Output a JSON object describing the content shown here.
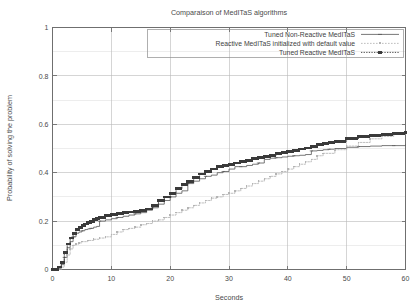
{
  "chart_data": {
    "type": "line",
    "title": "Comparaison of MedITaS algorithms",
    "xlabel": "Seconds",
    "ylabel": "Probability of solving the problem",
    "xlim": [
      0,
      60
    ],
    "ylim": [
      0,
      1
    ],
    "xticks": [
      "0",
      "10",
      "20",
      "30",
      "40",
      "50",
      "60"
    ],
    "yticks": [
      "0",
      "0.2",
      "0.4",
      "0.6",
      "0.8",
      "1"
    ],
    "xtick_values": [
      0,
      10,
      20,
      30,
      40,
      50,
      60
    ],
    "ytick_values": [
      0,
      0.2,
      0.4,
      0.6,
      0.8,
      1
    ],
    "grid": "major and minor horizontal gridlines at 0.1 steps, vertical at 10 s steps",
    "legend_position": "top-right inside plot",
    "series": [
      {
        "name": "Tuned Non-Reactive MedITaS",
        "style": "solid-thin-line",
        "color": "#555555",
        "x": [
          0,
          1.0,
          1.5,
          2.0,
          2.5,
          3.0,
          3.5,
          4.0,
          4.5,
          5.0,
          5.5,
          6.0,
          6.5,
          7.0,
          7.5,
          8.0,
          9.0,
          10.0,
          11.0,
          12.0,
          13.0,
          14.0,
          15.0,
          16.0,
          17.0,
          18.0,
          19.0,
          20.0,
          21.0,
          22.0,
          23.0,
          24.0,
          25.0,
          26.0,
          27.0,
          28.0,
          29.0,
          30.0,
          31.0,
          32.0,
          33.0,
          34.0,
          35.0,
          36.0,
          37.0,
          38.0,
          39.0,
          40.0,
          41.0,
          42.0,
          43.0,
          44.0,
          45.0,
          46.0,
          47.0,
          48.0,
          50.0,
          52.0,
          54.0,
          56.0,
          58.0,
          60.0
        ],
        "y": [
          0.0,
          0.005,
          0.02,
          0.05,
          0.09,
          0.115,
          0.135,
          0.15,
          0.155,
          0.16,
          0.165,
          0.168,
          0.17,
          0.175,
          0.178,
          0.2,
          0.205,
          0.21,
          0.215,
          0.22,
          0.225,
          0.23,
          0.235,
          0.245,
          0.255,
          0.27,
          0.285,
          0.3,
          0.315,
          0.325,
          0.355,
          0.365,
          0.375,
          0.385,
          0.39,
          0.4,
          0.405,
          0.415,
          0.425,
          0.425,
          0.43,
          0.435,
          0.44,
          0.455,
          0.46,
          0.462,
          0.465,
          0.468,
          0.47,
          0.472,
          0.475,
          0.49,
          0.492,
          0.495,
          0.497,
          0.5,
          0.505,
          0.508,
          0.51,
          0.512,
          0.512,
          0.515
        ]
      },
      {
        "name": "Reactive MedITaS initialized with default value",
        "style": "light-dotted-line",
        "color": "#b4b4b4",
        "x": [
          0,
          1.5,
          2.0,
          2.5,
          3.0,
          3.5,
          4.0,
          4.5,
          5.0,
          6.0,
          7.0,
          8.0,
          9.0,
          10.0,
          11.0,
          12.0,
          13.0,
          14.0,
          15.0,
          16.0,
          17.0,
          18.0,
          19.0,
          20.0,
          21.0,
          22.0,
          23.0,
          24.0,
          25.0,
          26.0,
          27.0,
          28.0,
          29.0,
          30.0,
          31.0,
          32.0,
          33.0,
          34.0,
          35.0,
          36.0,
          37.0,
          38.0,
          39.0,
          40.0,
          41.0,
          42.0,
          43.0,
          44.0,
          45.0,
          46.0,
          48.0,
          50.0,
          52.0,
          54.0,
          56.0,
          58.0,
          60.0
        ],
        "y": [
          0.0,
          0.01,
          0.03,
          0.06,
          0.085,
          0.1,
          0.105,
          0.11,
          0.115,
          0.12,
          0.125,
          0.13,
          0.135,
          0.145,
          0.155,
          0.165,
          0.17,
          0.175,
          0.185,
          0.19,
          0.2,
          0.205,
          0.215,
          0.225,
          0.235,
          0.245,
          0.255,
          0.265,
          0.275,
          0.285,
          0.295,
          0.3,
          0.31,
          0.315,
          0.325,
          0.335,
          0.345,
          0.355,
          0.365,
          0.375,
          0.385,
          0.395,
          0.405,
          0.415,
          0.425,
          0.435,
          0.445,
          0.455,
          0.47,
          0.48,
          0.495,
          0.51,
          0.525,
          0.54,
          0.55,
          0.558,
          0.565
        ]
      },
      {
        "name": "Tuned Reactive MedITaS",
        "style": "dotted-line-with-square-markers",
        "color": "#3a3a3a",
        "x": [
          0,
          1.0,
          1.5,
          2.0,
          2.5,
          3.0,
          3.5,
          4.0,
          4.5,
          5.0,
          5.5,
          6.0,
          6.5,
          7.0,
          7.5,
          8.0,
          9.0,
          10.0,
          11.0,
          12.0,
          13.0,
          14.0,
          15.0,
          16.0,
          17.0,
          18.0,
          19.0,
          20.0,
          21.0,
          22.0,
          23.0,
          24.0,
          25.0,
          26.0,
          27.0,
          28.0,
          29.0,
          30.0,
          31.0,
          32.0,
          33.0,
          34.0,
          35.0,
          36.0,
          37.0,
          38.0,
          39.0,
          40.0,
          41.0,
          42.0,
          43.0,
          44.0,
          45.0,
          46.0,
          47.0,
          48.0,
          50.0,
          52.0,
          54.0,
          56.0,
          58.0,
          60.0
        ],
        "y": [
          0.0,
          0.01,
          0.03,
          0.07,
          0.105,
          0.13,
          0.15,
          0.165,
          0.175,
          0.182,
          0.188,
          0.195,
          0.2,
          0.205,
          0.21,
          0.215,
          0.222,
          0.228,
          0.232,
          0.235,
          0.238,
          0.24,
          0.245,
          0.25,
          0.265,
          0.285,
          0.3,
          0.315,
          0.335,
          0.35,
          0.365,
          0.38,
          0.395,
          0.405,
          0.415,
          0.425,
          0.43,
          0.435,
          0.44,
          0.445,
          0.452,
          0.458,
          0.462,
          0.468,
          0.472,
          0.478,
          0.482,
          0.488,
          0.492,
          0.498,
          0.502,
          0.508,
          0.515,
          0.52,
          0.525,
          0.53,
          0.54,
          0.548,
          0.553,
          0.558,
          0.562,
          0.565
        ]
      }
    ]
  }
}
